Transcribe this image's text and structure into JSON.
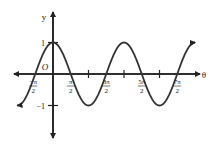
{
  "chart_data": {
    "type": "line",
    "title": "",
    "function": "y = cos(theta)",
    "xlabel": "θ",
    "ylabel": "y",
    "origin_label": "O",
    "xlim": [
      -2.1,
      4.3
    ],
    "ylim": [
      -2.0,
      2.2
    ],
    "grid": false,
    "legend": null,
    "x_ticks": [
      {
        "value": -0.5,
        "num": "−π",
        "den": "2"
      },
      {
        "value": 0.5,
        "num": "π",
        "den": "2"
      },
      {
        "value": 1.5,
        "num": "3π",
        "den": "2"
      },
      {
        "value": 2.5,
        "num": "5π",
        "den": "2"
      },
      {
        "value": 3.5,
        "num": "7π",
        "den": "2"
      }
    ],
    "x_unlabeled_ticks": [
      1.0,
      2.0,
      3.0
    ],
    "x_ticks_unit": "π",
    "y_ticks": [
      {
        "value": 1,
        "label": "1"
      },
      {
        "value": -1,
        "label": "−1"
      }
    ],
    "series": [
      {
        "name": "cos θ",
        "x_range_pi": [
          -1.0,
          4.0
        ],
        "amplitude": 1,
        "period_pi": 2
      }
    ]
  },
  "layout": {
    "origin_px": [
      53,
      74
    ],
    "px_per_pi": 35.5,
    "px_per_unit_y": 31.5,
    "x_axis_px": [
      14,
      200
    ],
    "y_axis_px": [
      12,
      138
    ]
  }
}
